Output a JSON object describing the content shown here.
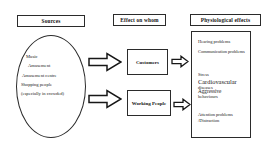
{
  "diagram": {
    "columns": [
      {
        "id": "sources",
        "label": "Sources"
      },
      {
        "id": "effect_on_whom",
        "label": "Effect on whom"
      },
      {
        "id": "physiological_effects",
        "label": "Physiological effects"
      }
    ],
    "sources_ellipse": {
      "items": [
        "Music",
        "Amusement",
        "Amusement centre",
        "Shopping people",
        "(especially in crowded)"
      ]
    },
    "affected_groups": [
      {
        "id": "customers",
        "label": "Customers"
      },
      {
        "id": "working_people",
        "label": "Working People"
      }
    ],
    "effects_panel": {
      "items": [
        "Hearing problems",
        "Communication problems",
        "Stress",
        "Cardiovascular",
        "diseases",
        "Aggressive",
        "behaviours",
        "Attention problems",
        "/Distraction"
      ]
    },
    "arrows": [
      {
        "id": "sources-to-customers",
        "direction": "right",
        "style": "hollow-block"
      },
      {
        "id": "sources-to-working-people",
        "direction": "right",
        "style": "hollow-block"
      },
      {
        "id": "customers-to-effects",
        "direction": "right",
        "style": "hollow-block"
      },
      {
        "id": "working-people-to-effects",
        "direction": "right",
        "style": "hollow-block"
      }
    ],
    "colors": {
      "stroke": "#2b2b2b",
      "text": "#1a1a1a",
      "background": "#ffffff"
    }
  }
}
